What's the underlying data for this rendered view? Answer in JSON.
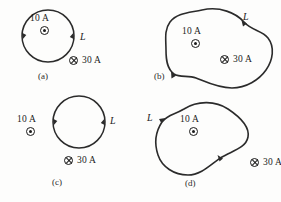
{
  "figure": {
    "background_color": "#fdfdfc",
    "stroke_color": "#2b2b2b",
    "text_color": "#1b1b1b"
  },
  "symbols": {
    "out_of_page": "dot-in-circle-icon",
    "into_page": "cross-in-circle-icon"
  },
  "panels": [
    {
      "id": "a",
      "letter": "(a)",
      "shape": "circle",
      "shape_label": "L",
      "current_out": "10 A",
      "current_in": "30 A",
      "out_inside_loop": true,
      "in_inside_loop": false
    },
    {
      "id": "b",
      "letter": "(b)",
      "shape": "blob",
      "shape_label": "L",
      "current_out": "10 A",
      "current_in": "30 A",
      "out_inside_loop": true,
      "in_inside_loop": true
    },
    {
      "id": "c",
      "letter": "(c)",
      "shape": "circle",
      "shape_label": "L",
      "current_out": "10 A",
      "current_in": "30 A",
      "out_inside_loop": false,
      "in_inside_loop": false
    },
    {
      "id": "d",
      "letter": "(d)",
      "shape": "blob",
      "shape_label": "L",
      "current_out": "10 A",
      "current_in": "30 A",
      "out_inside_loop": true,
      "in_inside_loop": false
    }
  ]
}
